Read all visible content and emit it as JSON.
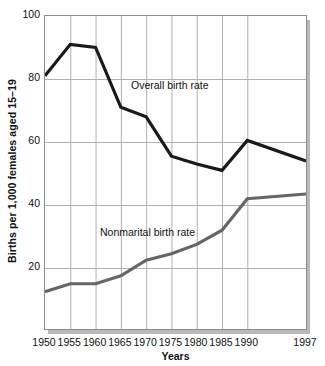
{
  "chart_data": {
    "type": "line",
    "title": "",
    "subtitle": "",
    "xlabel": "Years",
    "ylabel": "Births per 1,000 females aged 15–19",
    "x": [
      1950,
      1955,
      1960,
      1965,
      1970,
      1975,
      1980,
      1985,
      1990,
      1997
    ],
    "xticklabels": [
      "1950",
      "1955",
      "1960",
      "1965",
      "1970",
      "1975",
      "1980",
      "1985",
      "1990",
      "1997"
    ],
    "yticklabels": [
      "100",
      "80",
      "60",
      "40",
      "20"
    ],
    "yticks": [
      100,
      80,
      60,
      40,
      20
    ],
    "xlim": [
      1950,
      1997
    ],
    "ylim": [
      0,
      100
    ],
    "grid": true,
    "legend_position": "inline-annotation",
    "series": [
      {
        "name": "Overall birth rate",
        "color": "#1a1a1a",
        "values": [
          81,
          91,
          90,
          71,
          68,
          55.5,
          53,
          51,
          60.5,
          54
        ]
      },
      {
        "name": "Nonmarital birth rate",
        "color": "#666666",
        "values": [
          12.5,
          15,
          15,
          17.5,
          22.5,
          24.5,
          27.5,
          32,
          42,
          43.5
        ]
      }
    ],
    "annotations": [
      {
        "text": "Overall birth rate",
        "x": 1963,
        "y": 76
      },
      {
        "text": "Nonmarital birth rate",
        "x": 1958,
        "y": 31
      }
    ]
  },
  "axis": {
    "y_title": "Births per 1,000 females aged 15–19",
    "x_title": "Years"
  },
  "colors": {
    "overall_line": "#1a1a1a",
    "nonmarital_line": "#666666",
    "gridline": "#b0b0b0",
    "frame": "#8c8c8c",
    "shadow": "#b9b9b9",
    "plot_background": "#ffffff",
    "text": "#111111"
  }
}
